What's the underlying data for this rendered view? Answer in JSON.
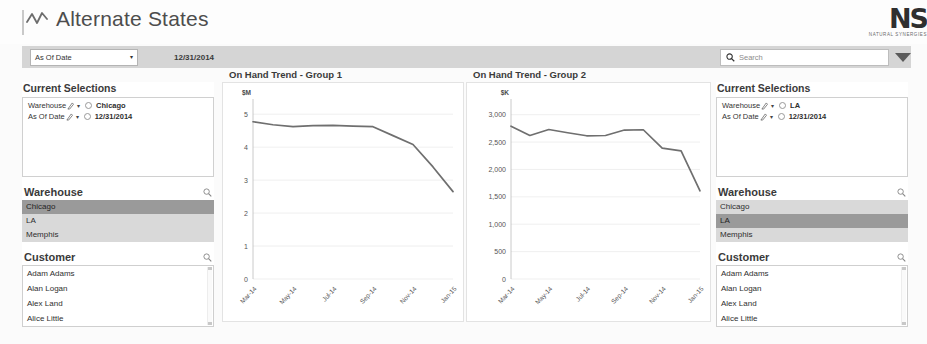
{
  "header": {
    "title": "Alternate States",
    "title_icon": "zigzag-line-icon",
    "logo_mark": "NS",
    "logo_tagline": "NATURAL SYNERGIES"
  },
  "toolbar": {
    "filter_label": "As Of Date",
    "filter_caret": "▾",
    "as_of_value": "12/31/2014",
    "search_placeholder": "Search",
    "search_icon": "search-icon",
    "dropdown_icon": "chevron-down-icon"
  },
  "left_panel": {
    "current_selections": {
      "title": "Current Selections",
      "rows": [
        {
          "field": "Warehouse",
          "value": "Chicago"
        },
        {
          "field": "As Of Date",
          "value": "12/31/2014"
        }
      ]
    },
    "warehouse": {
      "title": "Warehouse",
      "items": [
        {
          "label": "Chicago",
          "selected": true
        },
        {
          "label": "LA",
          "selected": false
        },
        {
          "label": "Memphis",
          "selected": false
        }
      ]
    },
    "customer": {
      "title": "Customer",
      "items": [
        "Adam Adams",
        "Alan Logan",
        "Alex Land",
        "Alice Little"
      ]
    }
  },
  "right_panel": {
    "current_selections": {
      "title": "Current Selections",
      "rows": [
        {
          "field": "Warehouse",
          "value": "LA"
        },
        {
          "field": "As Of Date",
          "value": "12/31/2014"
        }
      ]
    },
    "warehouse": {
      "title": "Warehouse",
      "items": [
        {
          "label": "Chicago",
          "selected": false
        },
        {
          "label": "LA",
          "selected": true
        },
        {
          "label": "Memphis",
          "selected": false
        }
      ]
    },
    "customer": {
      "title": "Customer",
      "items": [
        "Adam Adams",
        "Alan Logan",
        "Alex Land",
        "Alice Little"
      ]
    }
  },
  "chart_data": [
    {
      "type": "line",
      "title": "On Hand Trend - Group 1",
      "xlabel": "",
      "ylabel": "$M",
      "ylim": [
        0,
        5.4
      ],
      "yticks": [
        0,
        1,
        2,
        3,
        4,
        5
      ],
      "ytick_labels": [
        "0",
        "1",
        "2",
        "3",
        "4",
        "5"
      ],
      "grid": true,
      "legend": "none",
      "x": [
        "Mar-14",
        "Apr-14",
        "May-14",
        "Jun-14",
        "Jul-14",
        "Aug-14",
        "Sep-14",
        "Oct-14",
        "Nov-14",
        "Dec-14",
        "Jan-15"
      ],
      "xtick_labels": [
        "Mar-14",
        "May-14",
        "Jul-14",
        "Sep-14",
        "Nov-14",
        "Jan-15"
      ],
      "values": [
        4.77,
        4.68,
        4.62,
        4.65,
        4.66,
        4.64,
        4.62,
        4.35,
        4.08,
        3.4,
        2.65
      ]
    },
    {
      "type": "line",
      "title": "On Hand Trend - Group 2",
      "xlabel": "",
      "ylabel": "$K",
      "ylim": [
        0,
        3250
      ],
      "yticks": [
        0,
        500,
        1000,
        1500,
        2000,
        2500,
        3000
      ],
      "ytick_labels": [
        "0",
        "500",
        "1,000",
        "1,500",
        "2,000",
        "2,500",
        "3,000"
      ],
      "grid": true,
      "legend": "none",
      "x": [
        "Mar-14",
        "Apr-14",
        "May-14",
        "Jun-14",
        "Jul-14",
        "Aug-14",
        "Sep-14",
        "Oct-14",
        "Nov-14",
        "Dec-14",
        "Jan-15"
      ],
      "xtick_labels": [
        "Mar-14",
        "May-14",
        "Jul-14",
        "Sep-14",
        "Nov-14",
        "Jan-15"
      ],
      "values": [
        2790,
        2620,
        2730,
        2670,
        2615,
        2620,
        2720,
        2725,
        2390,
        2340,
        1610
      ]
    }
  ]
}
